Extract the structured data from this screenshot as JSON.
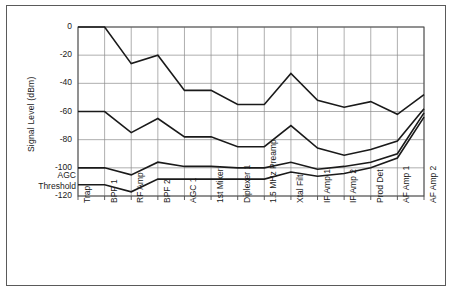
{
  "figure": {
    "background_color": "#ffffff",
    "frame_color": "#5a5a5a",
    "line_color": "#1a1a1a",
    "grid_color": "#8c8c8c"
  },
  "chart_data": {
    "type": "line",
    "title": "",
    "xlabel": "",
    "ylabel": "Signal Level (dBm)",
    "ylim": [
      -120,
      0
    ],
    "yticks": [
      0,
      -20,
      -40,
      -60,
      -80,
      -100,
      -120
    ],
    "ytick_labels": [
      "0",
      "-20",
      "-40",
      "-60",
      "-80",
      "-100",
      "-120"
    ],
    "grid": true,
    "legend_position": "none",
    "annotations": [
      {
        "text": "AGC",
        "target": "y-axis-left",
        "value": -103
      },
      {
        "text": "Threshold",
        "target": "y-axis-left",
        "value": -110
      }
    ],
    "categories": [
      "Trap",
      "BPF 1",
      "RF Amp",
      "BPF 2",
      "AGC 1",
      "1st Mixer",
      "Diplexer 1",
      "1.5 MHz Preamp",
      "Xtal Filt",
      "IF Amp 1",
      "IF Amp 2",
      "Prod Det",
      "AF Amp 1",
      "AF Amp 2"
    ],
    "series": [
      {
        "name": "Maximum signal level",
        "values": [
          0,
          0,
          -26,
          -20,
          -45,
          -45,
          -55,
          -55,
          -33,
          -52,
          -57,
          -53,
          -62,
          -48
        ]
      },
      {
        "name": "Mid signal level",
        "values": [
          -60,
          -60,
          -75,
          -65,
          -78,
          -78,
          -85,
          -85,
          -70,
          -86,
          -91,
          -87,
          -81,
          -58
        ]
      },
      {
        "name": "AGC threshold level",
        "values": [
          -100,
          -100,
          -105,
          -96,
          -99,
          -99,
          -100,
          -100,
          -96,
          -101,
          -99,
          -96,
          -90,
          -61
        ]
      },
      {
        "name": "Minimum discernible signal",
        "values": [
          -112,
          -112,
          -117,
          -108,
          -108,
          -108,
          -108,
          -108,
          -103,
          -106,
          -104,
          -100,
          -93,
          -64
        ]
      }
    ]
  }
}
